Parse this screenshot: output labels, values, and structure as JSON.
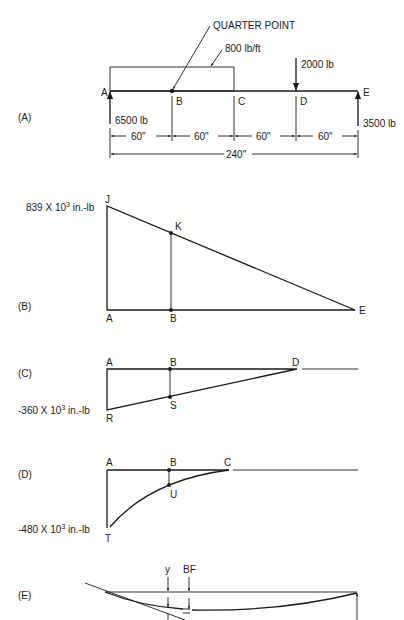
{
  "figure": {
    "panelA": {
      "label": "(A)",
      "title_callout": "QUARTER POINT",
      "distributed_load": "800 lb/ft",
      "point_load": "2000 lb",
      "reaction_left": "6500 lb",
      "reaction_right": "3500 lb",
      "points": [
        "A",
        "B",
        "C",
        "D",
        "E"
      ],
      "spans": [
        "60\"",
        "60\"",
        "60\"",
        "60\""
      ],
      "total_span": "240\""
    },
    "panelB": {
      "label": "(B)",
      "max_moment": "839 X 10",
      "exp": "3",
      "unit": " in.-lb",
      "points": {
        "J": "J",
        "K": "K",
        "A": "A",
        "B": "B",
        "E": "E"
      }
    },
    "panelC": {
      "label": "(C)",
      "moment": "-360 X 10",
      "exp": "3",
      "unit": " in.-lb",
      "points": {
        "A": "A",
        "B": "B",
        "D": "D",
        "S": "S",
        "R": "R"
      }
    },
    "panelD": {
      "label": "(D)",
      "moment": "-480 X 10",
      "exp": "3",
      "unit": " in.-lb",
      "points": {
        "A": "A",
        "B": "B",
        "C": "C",
        "U": "U",
        "T": "T"
      }
    },
    "panelE": {
      "label": "(E)",
      "y_label": "y",
      "bf_label": "BF"
    }
  }
}
